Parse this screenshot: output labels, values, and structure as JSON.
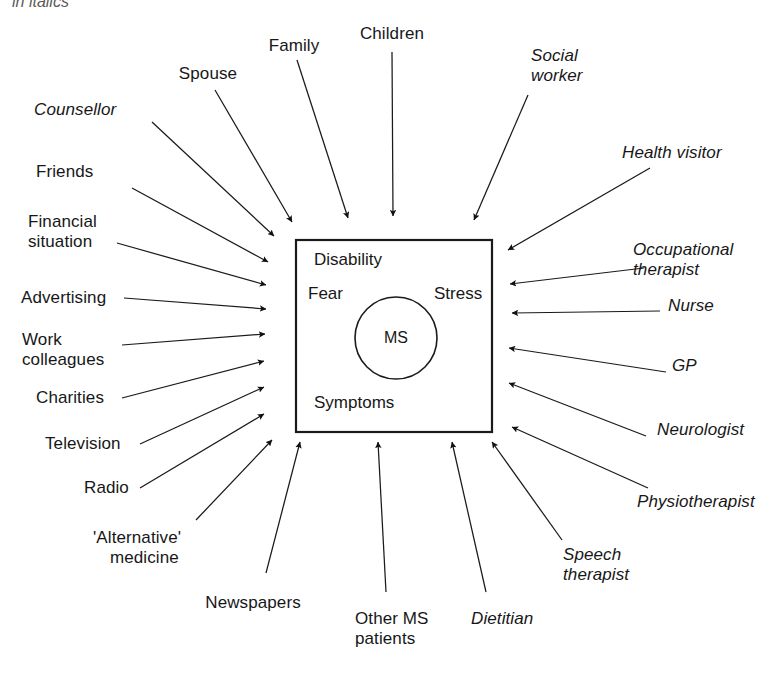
{
  "header": {
    "note": "in italics"
  },
  "center": {
    "box_label_disability": "Disability",
    "box_label_fear": "Fear",
    "box_label_stress": "Stress",
    "box_label_symptoms": "Symptoms",
    "circle_label": "MS"
  },
  "colors": {
    "stroke": "#1a1a1a",
    "arrow_fill": "#111111",
    "background": "#ffffff",
    "text": "#171717"
  },
  "diagram": {
    "type": "radial-influence-diagram",
    "center_entity": "MS",
    "note": "Professional/clinical sources shown in italics; personal and media sources upright",
    "nodes": [
      {
        "label": "Spouse",
        "italic": false,
        "side": "top"
      },
      {
        "label": "Family",
        "italic": false,
        "side": "top"
      },
      {
        "label": "Children",
        "italic": false,
        "side": "top"
      },
      {
        "label": "Social\nworker",
        "italic": true,
        "side": "top-right"
      },
      {
        "label": "Counsellor",
        "italic": true,
        "side": "left"
      },
      {
        "label": "Friends",
        "italic": false,
        "side": "left"
      },
      {
        "label": "Financial\nsituation",
        "italic": false,
        "side": "left"
      },
      {
        "label": "Advertising",
        "italic": false,
        "side": "left"
      },
      {
        "label": "Work\ncolleagues",
        "italic": false,
        "side": "left"
      },
      {
        "label": "Charities",
        "italic": false,
        "side": "left"
      },
      {
        "label": "Television",
        "italic": false,
        "side": "left"
      },
      {
        "label": "Radio",
        "italic": false,
        "side": "bottom-left"
      },
      {
        "label": "'Alternative'\nmedicine",
        "italic": false,
        "side": "bottom-left"
      },
      {
        "label": "Newspapers",
        "italic": false,
        "side": "bottom"
      },
      {
        "label": "Other MS\npatients",
        "italic": false,
        "side": "bottom"
      },
      {
        "label": "Dietitian",
        "italic": true,
        "side": "bottom"
      },
      {
        "label": "Speech\ntherapist",
        "italic": true,
        "side": "bottom-right"
      },
      {
        "label": "Physiotherapist",
        "italic": true,
        "side": "right"
      },
      {
        "label": "Neurologist",
        "italic": true,
        "side": "right"
      },
      {
        "label": "GP",
        "italic": true,
        "side": "right"
      },
      {
        "label": "Nurse",
        "italic": true,
        "side": "right"
      },
      {
        "label": "Occupational\ntherapist",
        "italic": true,
        "side": "right"
      },
      {
        "label": "Health visitor",
        "italic": true,
        "side": "right"
      }
    ]
  },
  "labels": {
    "spouse": "Spouse",
    "family": "Family",
    "children": "Children",
    "social_worker_l1": "Social",
    "social_worker_l2": "worker",
    "counsellor": "Counsellor",
    "friends": "Friends",
    "financial_l1": "Financial",
    "financial_l2": "situation",
    "advertising": "Advertising",
    "work_l1": "Work",
    "work_l2": "colleagues",
    "charities": "Charities",
    "television": "Television",
    "radio": "Radio",
    "alternative_l1": "'Alternative'",
    "alternative_l2": "medicine",
    "newspapers": "Newspapers",
    "other_ms_l1": "Other MS",
    "other_ms_l2": "patients",
    "dietitian": "Dietitian",
    "speech_l1": "Speech",
    "speech_l2": "therapist",
    "physiotherapist": "Physiotherapist",
    "neurologist": "Neurologist",
    "gp": "GP",
    "nurse": "Nurse",
    "health_visitor": "Health visitor",
    "occupational_l1": "Occupational",
    "occupational_l2": "therapist"
  }
}
